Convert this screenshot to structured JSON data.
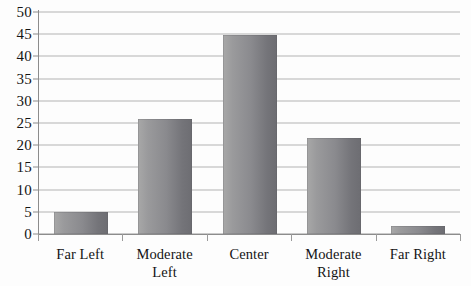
{
  "chart_data": {
    "type": "bar",
    "title": "",
    "subtitle": "",
    "xlabel": "",
    "ylabel": "",
    "categories": [
      "Far Left",
      "Moderate Left",
      "Center",
      "Moderate Right",
      "Far Right"
    ],
    "values": [
      5,
      26,
      44.8,
      21.7,
      1.7
    ],
    "ylim": [
      0,
      50
    ],
    "y_ticks": [
      0,
      5,
      10,
      15,
      20,
      25,
      30,
      35,
      40,
      45,
      50
    ],
    "y_tick_labels": [
      "0",
      "5",
      "10",
      "15",
      "20",
      "25",
      "30",
      "35",
      "40",
      "45",
      "50"
    ],
    "grid": true,
    "grid_axis": "y",
    "legend": false,
    "legend_position": "none",
    "bar_color": "#8a8a8e",
    "grid_color": "#b4b4b4",
    "axis_color": "#8c8c8c",
    "text_color": "#141414",
    "background": "#ffffff"
  }
}
